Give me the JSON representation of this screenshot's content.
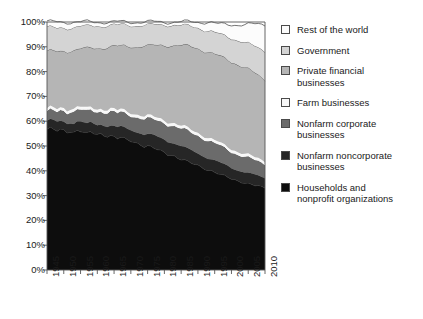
{
  "chart_data": {
    "type": "area",
    "stacked": true,
    "title": "",
    "xlabel": "",
    "ylabel": "",
    "xlim": [
      1945,
      2010
    ],
    "ylim": [
      0,
      100
    ],
    "ytick_labels": [
      "0%",
      "10%",
      "20%",
      "30%",
      "40%",
      "50%",
      "60%",
      "70%",
      "80%",
      "90%",
      "100%"
    ],
    "ytick_values": [
      0,
      10,
      20,
      30,
      40,
      50,
      60,
      70,
      80,
      90,
      100
    ],
    "xtick_labels": [
      "1945",
      "1950",
      "1955",
      "1960",
      "1965",
      "1970",
      "1975",
      "1980",
      "1985",
      "1990",
      "1995",
      "2000",
      "2005",
      "2010"
    ],
    "xtick_values": [
      1945,
      1950,
      1955,
      1960,
      1965,
      1970,
      1975,
      1980,
      1985,
      1990,
      1995,
      2000,
      2005,
      2010
    ],
    "grid": false,
    "legend_position": "right",
    "x": [
      1945,
      1946,
      1947,
      1948,
      1949,
      1950,
      1951,
      1952,
      1953,
      1954,
      1955,
      1956,
      1957,
      1958,
      1959,
      1960,
      1961,
      1962,
      1963,
      1964,
      1965,
      1966,
      1967,
      1968,
      1969,
      1970,
      1971,
      1972,
      1973,
      1974,
      1975,
      1976,
      1977,
      1978,
      1979,
      1980,
      1981,
      1982,
      1983,
      1984,
      1985,
      1986,
      1987,
      1988,
      1989,
      1990,
      1991,
      1992,
      1993,
      1994,
      1995,
      1996,
      1997,
      1998,
      1999,
      2000,
      2001,
      2002,
      2003,
      2004,
      2005,
      2006,
      2007,
      2008,
      2009,
      2010
    ],
    "series": [
      {
        "name": "Households and nonprofit organizations",
        "color": "#0d0d0d",
        "values": [
          56.8,
          57.2,
          56.6,
          56.0,
          56.6,
          56.4,
          55.6,
          56.0,
          55.6,
          56.4,
          56.0,
          55.4,
          55.0,
          55.6,
          55.0,
          54.6,
          55.0,
          54.4,
          54.0,
          54.2,
          53.8,
          53.0,
          53.4,
          53.0,
          52.4,
          52.0,
          51.6,
          51.2,
          50.6,
          49.8,
          50.0,
          49.6,
          49.0,
          48.4,
          48.0,
          47.4,
          46.6,
          46.4,
          46.0,
          45.2,
          44.6,
          44.2,
          43.6,
          43.0,
          42.6,
          42.2,
          41.6,
          41.0,
          40.4,
          40.0,
          39.4,
          38.8,
          38.2,
          37.8,
          37.4,
          36.8,
          36.4,
          36.0,
          35.6,
          35.2,
          34.8,
          34.4,
          34.0,
          33.8,
          33.4,
          33.2
        ]
      },
      {
        "name": "Nonfarm noncorporate businesses",
        "color": "#262626",
        "values": [
          3.4,
          3.4,
          3.5,
          3.5,
          3.5,
          3.6,
          3.6,
          3.6,
          3.7,
          3.7,
          3.8,
          3.8,
          3.8,
          3.9,
          3.9,
          4.0,
          4.0,
          4.1,
          4.1,
          4.2,
          4.2,
          4.3,
          4.3,
          4.4,
          4.4,
          4.5,
          4.6,
          4.6,
          4.7,
          4.8,
          4.8,
          4.9,
          5.0,
          5.1,
          5.2,
          5.3,
          5.3,
          5.3,
          5.3,
          5.3,
          5.2,
          5.2,
          5.1,
          5.1,
          5.0,
          5.0,
          4.9,
          4.9,
          4.8,
          4.8,
          4.7,
          4.7,
          4.6,
          4.6,
          4.5,
          4.5,
          4.5,
          4.4,
          4.4,
          4.3,
          4.3,
          4.2,
          4.2,
          4.1,
          4.1,
          4.0
        ]
      },
      {
        "name": "Nonfarm corporate businesses",
        "color": "#6b6b6b",
        "values": [
          3.6,
          3.8,
          4.0,
          4.2,
          4.4,
          4.5,
          4.6,
          4.7,
          4.8,
          4.8,
          4.9,
          5.0,
          5.1,
          5.1,
          5.2,
          5.3,
          5.4,
          5.5,
          5.6,
          5.7,
          5.8,
          5.8,
          5.9,
          5.9,
          6.0,
          6.0,
          6.0,
          6.1,
          6.2,
          6.4,
          6.4,
          6.4,
          6.5,
          6.6,
          6.7,
          6.8,
          7.0,
          7.0,
          7.0,
          7.1,
          7.2,
          7.2,
          7.3,
          7.3,
          7.3,
          7.3,
          7.3,
          7.2,
          7.2,
          7.1,
          7.0,
          7.0,
          6.9,
          6.8,
          6.7,
          6.6,
          6.5,
          6.5,
          6.4,
          6.3,
          6.2,
          6.1,
          6.0,
          5.9,
          5.8,
          5.8
        ]
      },
      {
        "name": "Farm businesses",
        "color": "#f7f7f7",
        "values": [
          1.0,
          1.0,
          1.0,
          1.0,
          1.0,
          1.0,
          1.0,
          1.0,
          1.0,
          1.0,
          1.0,
          1.0,
          1.0,
          1.0,
          1.0,
          1.0,
          1.0,
          1.0,
          1.0,
          1.0,
          1.0,
          1.0,
          1.0,
          1.0,
          1.0,
          1.0,
          1.0,
          1.0,
          1.0,
          1.0,
          1.0,
          1.0,
          1.0,
          1.0,
          1.0,
          1.0,
          1.0,
          1.0,
          1.0,
          1.0,
          1.0,
          1.0,
          1.0,
          1.0,
          1.0,
          1.0,
          1.0,
          1.0,
          1.0,
          1.0,
          1.0,
          1.0,
          1.0,
          1.0,
          1.0,
          1.0,
          1.0,
          1.0,
          1.0,
          1.0,
          1.0,
          1.0,
          1.0,
          1.0,
          1.0,
          1.0
        ]
      },
      {
        "name": "Private financial businesses",
        "color": "#b5b5b5",
        "values": [
          23.2,
          22.8,
          23.0,
          23.3,
          22.7,
          23.0,
          23.6,
          23.3,
          23.6,
          23.1,
          23.5,
          24.0,
          24.3,
          23.9,
          24.4,
          24.7,
          24.3,
          24.8,
          25.2,
          25.0,
          25.4,
          26.0,
          25.6,
          26.0,
          26.4,
          26.8,
          27.0,
          27.3,
          27.8,
          28.4,
          28.2,
          28.5,
          29.0,
          29.4,
          29.8,
          30.2,
          30.8,
          31.0,
          31.4,
          32.0,
          32.4,
          32.7,
          33.2,
          33.6,
          33.9,
          34.0,
          34.2,
          34.4,
          34.6,
          34.7,
          34.8,
          34.9,
          35.0,
          35.1,
          35.2,
          35.2,
          35.2,
          35.1,
          35.0,
          34.8,
          34.6,
          34.3,
          34.0,
          33.6,
          33.2,
          32.8
        ]
      },
      {
        "name": "Government",
        "color": "#d4d4d4",
        "values": [
          9.8,
          9.6,
          9.5,
          9.4,
          9.5,
          9.3,
          9.3,
          9.2,
          9.2,
          9.2,
          9.1,
          9.0,
          9.0,
          9.0,
          8.9,
          8.9,
          8.8,
          8.8,
          8.8,
          8.7,
          8.7,
          8.6,
          8.6,
          8.6,
          8.6,
          8.5,
          8.5,
          8.5,
          8.5,
          8.4,
          8.4,
          8.4,
          8.4,
          8.3,
          8.3,
          8.3,
          8.3,
          8.2,
          8.2,
          8.2,
          8.2,
          8.2,
          8.2,
          8.2,
          8.2,
          8.3,
          8.4,
          8.5,
          8.6,
          8.7,
          8.8,
          8.9,
          9.0,
          9.1,
          9.2,
          9.4,
          9.6,
          9.8,
          10.0,
          10.2,
          10.4,
          10.6,
          10.8,
          11.0,
          11.3,
          11.6
        ]
      },
      {
        "name": "Rest of the world",
        "color": "#fcfcfc",
        "values": [
          2.2,
          2.2,
          2.4,
          2.6,
          2.3,
          2.2,
          2.3,
          2.2,
          2.1,
          1.8,
          1.7,
          1.8,
          1.8,
          1.5,
          1.6,
          1.5,
          1.5,
          1.4,
          1.3,
          1.2,
          1.1,
          1.3,
          1.2,
          1.1,
          1.2,
          1.2,
          1.3,
          1.3,
          1.2,
          1.2,
          1.2,
          1.2,
          1.1,
          1.2,
          1.0,
          1.0,
          1.0,
          1.1,
          1.1,
          1.2,
          1.4,
          1.5,
          1.6,
          1.8,
          2.0,
          2.2,
          2.6,
          3.0,
          3.4,
          3.5,
          3.7,
          3.8,
          4.3,
          4.6,
          5.0,
          5.5,
          5.8,
          6.2,
          6.6,
          7.1,
          7.7,
          8.4,
          9.0,
          9.6,
          10.2,
          10.6
        ]
      }
    ],
    "legend_entries": [
      {
        "label": "Rest of the world",
        "color": "#fcfcfc"
      },
      {
        "label": "Government",
        "color": "#d4d4d4"
      },
      {
        "label": "Private financial\nbusinesses",
        "color": "#b5b5b5"
      },
      {
        "label": "Farm businesses",
        "color": "#f7f7f7"
      },
      {
        "label": "Nonfarm corporate\nbusinesses",
        "color": "#6b6b6b"
      },
      {
        "label": "Nonfarm noncorporate\nbusinesses",
        "color": "#262626"
      },
      {
        "label": "Households and\nnonprofit organizations",
        "color": "#0d0d0d"
      }
    ]
  }
}
